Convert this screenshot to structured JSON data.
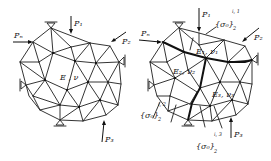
{
  "figure": {
    "colors": {
      "ink": "#1e1e1e",
      "background": "#ffffff"
    },
    "left_mesh": {
      "material_label": "E , ν",
      "loads": {
        "p1": "P₁",
        "p2": "P₂",
        "p3": "P₃",
        "pn": "Pₙ"
      },
      "supports": [
        "top-pin",
        "right-pin",
        "left-pin",
        "bottom-pin"
      ]
    },
    "right_mesh": {
      "subdomains": [
        {
          "id": 1,
          "label": "E₁, ν₁"
        },
        {
          "id": 2,
          "label": "E₂, ν₂"
        },
        {
          "id": 3,
          "label": "E₃, ν₃"
        }
      ],
      "loads": {
        "p1": "P₁",
        "p2": "P₂",
        "p3": "P₃",
        "pn": "Pₙ"
      },
      "interface_stress_labels": [
        {
          "base": "{σ₀}",
          "sub": "2",
          "sup": "i, 1"
        },
        {
          "base": "{σ₀}",
          "sub": "2",
          "sup": "i, 2"
        },
        {
          "base": "{σ₀}",
          "sub": "2",
          "sup": "i, 3"
        }
      ],
      "supports": [
        "top-pin",
        "right-pin",
        "left-pin",
        "bottom-pin"
      ]
    }
  }
}
